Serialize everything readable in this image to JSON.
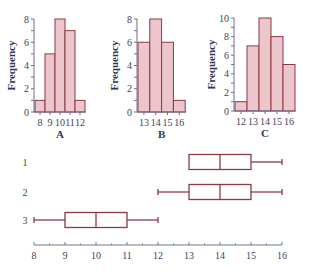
{
  "chart_data": [
    {
      "type": "bar",
      "title": "A",
      "xlabel": "A",
      "ylabel": "Frequency",
      "categories": [
        "8",
        "9",
        "10",
        "11",
        "12"
      ],
      "values": [
        1,
        5,
        8,
        7,
        1
      ],
      "yticks": [
        0,
        2,
        4,
        6,
        8
      ],
      "ylim": [
        0,
        8
      ],
      "grid": false
    },
    {
      "type": "bar",
      "title": "B",
      "xlabel": "B",
      "ylabel": "Frequency",
      "categories": [
        "13",
        "14",
        "15",
        "16"
      ],
      "values": [
        6,
        8,
        6,
        1
      ],
      "yticks": [
        0,
        2,
        4,
        6,
        8
      ],
      "ylim": [
        0,
        8
      ],
      "grid": false
    },
    {
      "type": "bar",
      "title": "C",
      "xlabel": "C",
      "ylabel": "Frequency",
      "categories": [
        "12",
        "13",
        "14",
        "15",
        "16"
      ],
      "values": [
        1,
        7,
        10,
        8,
        5
      ],
      "yticks": [
        0,
        2,
        4,
        6,
        8,
        10
      ],
      "ylim": [
        0,
        10
      ],
      "grid": false
    },
    {
      "type": "boxplot",
      "title": "",
      "xlabel": "",
      "ylabel": "",
      "xticks": [
        8,
        9,
        10,
        11,
        12,
        13,
        14,
        15,
        16
      ],
      "xlim": [
        8,
        16
      ],
      "series": [
        {
          "name": "1",
          "min": 13,
          "q1": 13,
          "median": 14,
          "q3": 15,
          "max": 16
        },
        {
          "name": "2",
          "min": 12,
          "q1": 13,
          "median": 14,
          "q3": 15,
          "max": 16
        },
        {
          "name": "3",
          "min": 8,
          "q1": 9,
          "median": 10,
          "q3": 11,
          "max": 12
        }
      ],
      "grid": false
    }
  ],
  "colors": {
    "bar_fill": "#ecc6cb",
    "bar_stroke": "#8c3945",
    "axis": "#6d7496",
    "text": "#3a3f5a"
  }
}
